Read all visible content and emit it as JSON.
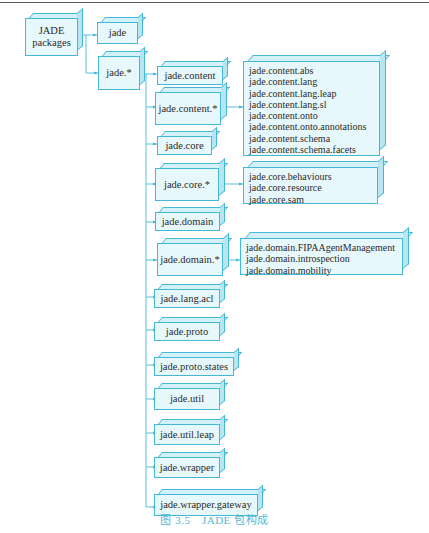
{
  "root": {
    "label_line1": "JADE",
    "label_line2": "packages"
  },
  "level1": [
    {
      "label": "jade"
    },
    {
      "label": "jade.*"
    }
  ],
  "children": [
    {
      "label": "jade.content"
    },
    {
      "label": "jade.content.*"
    },
    {
      "label": "jade.core"
    },
    {
      "label": "jade.core.*"
    },
    {
      "label": "jade.domain"
    },
    {
      "label": "jade.domain.*"
    },
    {
      "label": "jade.lang.acl"
    },
    {
      "label": "jade.proto"
    },
    {
      "label": "jade.proto.states"
    },
    {
      "label": "jade.util"
    },
    {
      "label": "jade.util.leap"
    },
    {
      "label": "jade.wrapper"
    },
    {
      "label": "jade.wrapper.gateway"
    }
  ],
  "subpackages": {
    "content": [
      "jade.content.abs",
      "jade.content.lang",
      "jade.content.lang.leap",
      "jade.content.lang.sl",
      "jade.content.onto",
      "jade.content.onto.annotations",
      "jade.content.schema",
      "jade.content.schema.facets"
    ],
    "core": [
      "jade.core.behaviours",
      "jade.core.resource",
      "jade.core.sam"
    ],
    "domain": [
      "jade.domain.FIPAAgentManagement",
      "jade.domain.introspection",
      "jade.domain.mobility"
    ]
  },
  "caption": "图 3.5　JADE 包构成",
  "colors": {
    "border": "#45b8d6",
    "fill": "#e6f8fc",
    "line": "#45b8d6",
    "caption": "#4fb7d6"
  }
}
